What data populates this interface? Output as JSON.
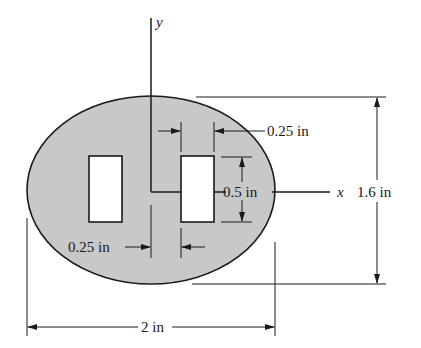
{
  "diagram": {
    "type": "cross-section with two rectangular holes",
    "colors": {
      "fill": "#c8c8c8",
      "stroke": "#1a1a1a",
      "background": "#ffffff"
    },
    "axes": {
      "x_label": "x",
      "y_label": "y"
    },
    "dimensions": {
      "overall_width": "2 in",
      "overall_height": "1.6 in",
      "hole_width_right": "0.25 in",
      "hole_spacing_left": "0.25 in",
      "hole_height": "0.5 in"
    }
  }
}
